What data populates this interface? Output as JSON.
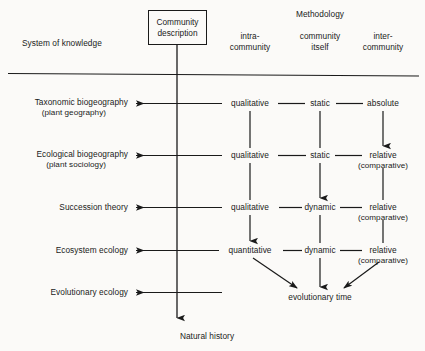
{
  "diagram": {
    "title_left": "System of knowledge",
    "methodology_header": "Methodology",
    "central_box": {
      "line1": "Community",
      "line2": "description"
    },
    "column_headers": [
      {
        "line1": "intra-",
        "line2": "community"
      },
      {
        "line1": "community",
        "line2": "itself"
      },
      {
        "line1": "inter-",
        "line2": "community"
      }
    ],
    "rows": [
      {
        "name_line1": "Taxonomic biogeography",
        "name_line2": "(plant geography)",
        "intra": "qualitative",
        "itself": "static",
        "inter_line1": "absolute",
        "inter_line2": ""
      },
      {
        "name_line1": "Ecological biogeography",
        "name_line2": "(plant sociology)",
        "intra": "qualitative",
        "itself": "static",
        "inter_line1": "relative",
        "inter_line2": "(comparative)"
      },
      {
        "name_line1": "Succession theory",
        "name_line2": "",
        "intra": "qualitative",
        "itself": "dynamic",
        "inter_line1": "relative",
        "inter_line2": "(comparative)"
      },
      {
        "name_line1": "Ecosystem ecology",
        "name_line2": "",
        "intra": "quantitative",
        "itself": "dynamic",
        "inter_line1": "relative",
        "inter_line2": "(comparative)"
      },
      {
        "name_line1": "Evolutionary ecology",
        "name_line2": "",
        "intra": "",
        "itself": "",
        "inter_line1": "",
        "inter_line2": ""
      }
    ],
    "convergence_label": "evolutionary time",
    "bottom_label": "Natural history",
    "colors": {
      "ink": "#1a1a1a",
      "background": "#fbfaf8"
    }
  }
}
